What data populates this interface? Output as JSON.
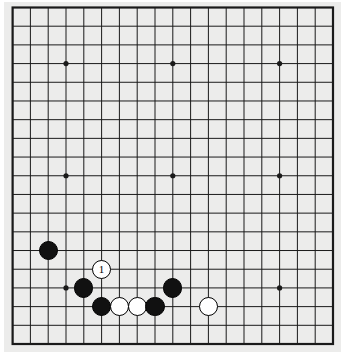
{
  "app": {
    "title": "Go Board Diagram",
    "background_color": "#ffffff",
    "board_color": "#ececeb",
    "line_color": "#1a1a1a",
    "black_color": "#111111",
    "white_color": "#ffffff"
  },
  "board": {
    "size": 19,
    "label": "19x19 go board",
    "left": 12.6,
    "top": 7.5,
    "right": 333.0,
    "bottom": 344.0,
    "border_width": 2.2,
    "line_width": 1.0,
    "star_radius": 2.6,
    "stone_radius": 9.6,
    "star_points": [
      {
        "col": 3,
        "row": 3
      },
      {
        "col": 9,
        "row": 3
      },
      {
        "col": 15,
        "row": 3
      },
      {
        "col": 3,
        "row": 9
      },
      {
        "col": 9,
        "row": 9
      },
      {
        "col": 15,
        "row": 9
      },
      {
        "col": 3,
        "row": 15
      },
      {
        "col": 9,
        "row": 15
      },
      {
        "col": 15,
        "row": 15
      }
    ]
  },
  "stones": [
    {
      "name": "black-stone-d6",
      "color": "black",
      "col": 2,
      "row": 13,
      "label": ""
    },
    {
      "name": "white-stone-move-1",
      "color": "white",
      "col": 5,
      "row": 14,
      "label": "1"
    },
    {
      "name": "black-stone-c4",
      "color": "black",
      "col": 4,
      "row": 15,
      "label": ""
    },
    {
      "name": "black-stone-h4",
      "color": "black",
      "col": 9,
      "row": 15,
      "label": ""
    },
    {
      "name": "black-stone-d3",
      "color": "black",
      "col": 5,
      "row": 16,
      "label": ""
    },
    {
      "name": "white-stone-e3",
      "color": "white",
      "col": 6,
      "row": 16,
      "label": ""
    },
    {
      "name": "white-stone-f3",
      "color": "white",
      "col": 7,
      "row": 16,
      "label": ""
    },
    {
      "name": "black-stone-g3",
      "color": "black",
      "col": 8,
      "row": 16,
      "label": ""
    },
    {
      "name": "white-stone-k3",
      "color": "white",
      "col": 11,
      "row": 16,
      "label": ""
    }
  ]
}
